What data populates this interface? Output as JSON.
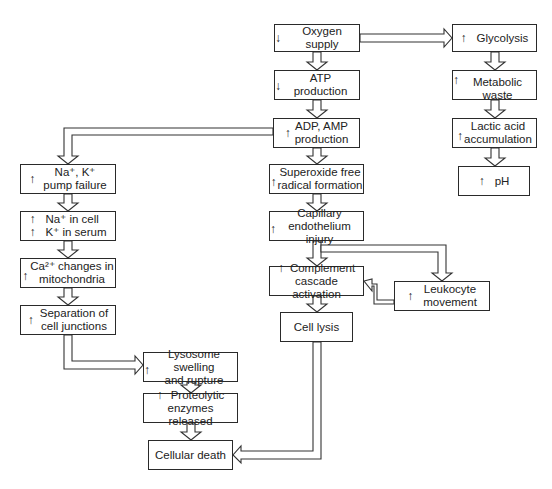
{
  "diagram": {
    "arrow_glyphs": {
      "increase": "↑",
      "decrease": "↓"
    },
    "nodes": [
      {
        "id": "oxygen",
        "indicator": "decrease",
        "lines": [
          "Oxygen supply"
        ]
      },
      {
        "id": "glycolysis",
        "indicator": "increase",
        "lines": [
          "Glycolysis"
        ]
      },
      {
        "id": "atp",
        "indicator": "decrease",
        "lines": [
          "ATP production"
        ]
      },
      {
        "id": "metabolic",
        "indicator": "increase",
        "lines": [
          "Metabolic waste"
        ]
      },
      {
        "id": "adp",
        "indicator": "increase",
        "lines": [
          "ADP, AMP",
          "production"
        ]
      },
      {
        "id": "lactic",
        "indicator": "increase",
        "lines": [
          "Lactic acid",
          "accumulation"
        ]
      },
      {
        "id": "ph",
        "indicator": "increase",
        "lines": [
          "pH"
        ]
      },
      {
        "id": "pump",
        "indicator": "increase",
        "lines": [
          "Na⁺, K⁺",
          "pump failure"
        ]
      },
      {
        "id": "superoxide",
        "indicator": "increase",
        "lines": [
          "Superoxide free",
          "radical formation"
        ]
      },
      {
        "id": "na_cell",
        "indicator": "increase",
        "lines": [
          "Na⁺ in cell",
          "K⁺ in serum"
        ],
        "indicator_each_line": true
      },
      {
        "id": "capillary",
        "indicator": "increase",
        "lines": [
          "Capillary",
          "endothelium injury"
        ]
      },
      {
        "id": "calcium",
        "indicator": "increase",
        "lines": [
          "Ca²⁺ changes in",
          "mitochondria"
        ]
      },
      {
        "id": "complement",
        "indicator": "increase",
        "lines": [
          "Complement",
          "cascade activation"
        ]
      },
      {
        "id": "leukocyte",
        "indicator": "increase",
        "lines": [
          "Leukocyte",
          "movement"
        ]
      },
      {
        "id": "separation",
        "indicator": "increase",
        "lines": [
          "Separation of",
          "cell junctions"
        ]
      },
      {
        "id": "lysis",
        "indicator": "none",
        "lines": [
          "Cell lysis"
        ]
      },
      {
        "id": "lysosome",
        "indicator": "increase",
        "lines": [
          "Lysosome swelling",
          "and rupture"
        ]
      },
      {
        "id": "proteolytic",
        "indicator": "increase",
        "lines": [
          "Proteolytic",
          "enzymes released"
        ]
      },
      {
        "id": "death",
        "indicator": "none",
        "lines": [
          "Cellular death"
        ]
      }
    ],
    "edges": [
      [
        "oxygen",
        "glycolysis"
      ],
      [
        "oxygen",
        "atp"
      ],
      [
        "glycolysis",
        "metabolic"
      ],
      [
        "metabolic",
        "lactic"
      ],
      [
        "lactic",
        "ph"
      ],
      [
        "atp",
        "adp"
      ],
      [
        "adp",
        "pump"
      ],
      [
        "adp",
        "superoxide"
      ],
      [
        "pump",
        "na_cell"
      ],
      [
        "na_cell",
        "calcium"
      ],
      [
        "calcium",
        "separation"
      ],
      [
        "separation",
        "lysosome"
      ],
      [
        "lysosome",
        "proteolytic"
      ],
      [
        "proteolytic",
        "death"
      ],
      [
        "superoxide",
        "capillary"
      ],
      [
        "capillary",
        "complement"
      ],
      [
        "capillary",
        "leukocyte"
      ],
      [
        "leukocyte",
        "complement"
      ],
      [
        "complement",
        "lysis"
      ],
      [
        "lysis",
        "death"
      ]
    ]
  }
}
